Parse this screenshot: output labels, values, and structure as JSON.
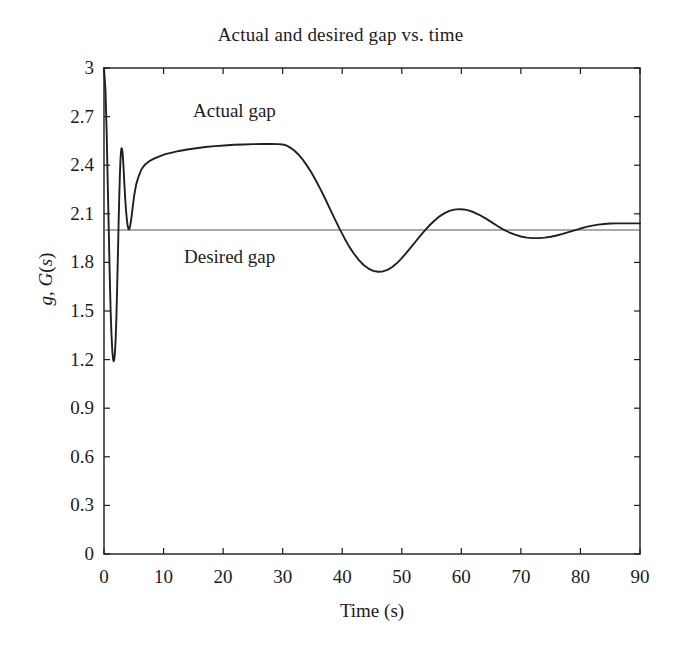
{
  "chart_data": {
    "type": "line",
    "title": "Actual and desired gap vs. time",
    "xlabel": "Time (s)",
    "ylabel": "g, G(s)",
    "ylabel_parts": {
      "pre": "g",
      "sep": ", ",
      "mid": "G",
      "open": "(",
      "var": "s",
      "close": ")"
    },
    "xlim": [
      0,
      90
    ],
    "ylim": [
      0,
      3
    ],
    "xticks": [
      0,
      10,
      20,
      30,
      40,
      50,
      60,
      70,
      80,
      90
    ],
    "xtick_labels": [
      "0",
      "10",
      "20",
      "30",
      "40",
      "50",
      "60",
      "70",
      "80",
      "90"
    ],
    "yticks": [
      0,
      0.3,
      0.6,
      0.9,
      1.2,
      1.5,
      1.8,
      2.1,
      2.4,
      2.7,
      3
    ],
    "ytick_labels": [
      "0",
      "0.3",
      "0.6",
      "0.9",
      "1.2",
      "1.5",
      "1.8",
      "2.1",
      "2.4",
      "2.7",
      "3"
    ],
    "grid": false,
    "legend_position": "inline-annotations",
    "annotations": [
      {
        "text": "Actual gap",
        "x": 15.5,
        "y": 2.74
      },
      {
        "text": "Desired gap",
        "x": 13.8,
        "y": 1.85
      }
    ],
    "series": [
      {
        "name": "Actual gap",
        "color": "#231f20",
        "linewidth": 1.9,
        "points": [
          [
            0.0,
            3.0
          ],
          [
            0.25,
            2.86
          ],
          [
            0.45,
            2.6
          ],
          [
            0.62,
            2.3
          ],
          [
            0.8,
            2.0
          ],
          [
            0.95,
            1.74
          ],
          [
            1.1,
            1.52
          ],
          [
            1.25,
            1.36
          ],
          [
            1.4,
            1.25
          ],
          [
            1.52,
            1.205
          ],
          [
            1.62,
            1.19
          ],
          [
            1.72,
            1.2
          ],
          [
            1.82,
            1.235
          ],
          [
            1.95,
            1.32
          ],
          [
            2.08,
            1.46
          ],
          [
            2.2,
            1.63
          ],
          [
            2.32,
            1.82
          ],
          [
            2.44,
            2.02
          ],
          [
            2.55,
            2.19
          ],
          [
            2.66,
            2.33
          ],
          [
            2.76,
            2.43
          ],
          [
            2.86,
            2.485
          ],
          [
            2.95,
            2.505
          ],
          [
            3.04,
            2.5
          ],
          [
            3.14,
            2.47
          ],
          [
            3.26,
            2.4
          ],
          [
            3.4,
            2.3
          ],
          [
            3.55,
            2.2
          ],
          [
            3.7,
            2.12
          ],
          [
            3.85,
            2.06
          ],
          [
            4.0,
            2.02
          ],
          [
            4.12,
            2.005
          ],
          [
            4.25,
            2.005
          ],
          [
            4.42,
            2.03
          ],
          [
            4.62,
            2.08
          ],
          [
            4.85,
            2.15
          ],
          [
            5.1,
            2.22
          ],
          [
            5.4,
            2.28
          ],
          [
            5.8,
            2.33
          ],
          [
            6.3,
            2.375
          ],
          [
            6.9,
            2.405
          ],
          [
            7.6,
            2.425
          ],
          [
            8.4,
            2.44
          ],
          [
            9.3,
            2.455
          ],
          [
            10.3,
            2.468
          ],
          [
            11.4,
            2.478
          ],
          [
            12.6,
            2.488
          ],
          [
            14.0,
            2.497
          ],
          [
            15.5,
            2.505
          ],
          [
            17.0,
            2.512
          ],
          [
            18.6,
            2.518
          ],
          [
            20.2,
            2.522
          ],
          [
            21.8,
            2.526
          ],
          [
            23.4,
            2.528
          ],
          [
            25.0,
            2.53
          ],
          [
            26.6,
            2.531
          ],
          [
            28.0,
            2.531
          ],
          [
            29.2,
            2.53
          ],
          [
            30.0,
            2.528
          ],
          [
            30.6,
            2.522
          ],
          [
            31.2,
            2.51
          ],
          [
            31.9,
            2.492
          ],
          [
            32.6,
            2.468
          ],
          [
            33.3,
            2.438
          ],
          [
            34.0,
            2.402
          ],
          [
            34.8,
            2.356
          ],
          [
            35.6,
            2.304
          ],
          [
            36.4,
            2.248
          ],
          [
            37.2,
            2.188
          ],
          [
            38.0,
            2.126
          ],
          [
            38.8,
            2.064
          ],
          [
            39.6,
            2.004
          ],
          [
            40.4,
            1.948
          ],
          [
            41.2,
            1.896
          ],
          [
            42.0,
            1.852
          ],
          [
            42.8,
            1.814
          ],
          [
            43.6,
            1.784
          ],
          [
            44.4,
            1.762
          ],
          [
            45.2,
            1.748
          ],
          [
            46.0,
            1.742
          ],
          [
            46.8,
            1.744
          ],
          [
            47.6,
            1.754
          ],
          [
            48.4,
            1.772
          ],
          [
            49.2,
            1.796
          ],
          [
            50.0,
            1.826
          ],
          [
            50.8,
            1.86
          ],
          [
            51.6,
            1.896
          ],
          [
            52.4,
            1.932
          ],
          [
            53.2,
            1.968
          ],
          [
            54.0,
            2.002
          ],
          [
            54.8,
            2.034
          ],
          [
            55.6,
            2.062
          ],
          [
            56.4,
            2.086
          ],
          [
            57.2,
            2.104
          ],
          [
            58.0,
            2.118
          ],
          [
            58.8,
            2.126
          ],
          [
            59.6,
            2.129
          ],
          [
            60.4,
            2.127
          ],
          [
            61.2,
            2.121
          ],
          [
            62.0,
            2.111
          ],
          [
            63.0,
            2.094
          ],
          [
            64.0,
            2.073
          ],
          [
            65.0,
            2.05
          ],
          [
            66.0,
            2.026
          ],
          [
            67.0,
            2.004
          ],
          [
            68.0,
            1.986
          ],
          [
            69.0,
            1.971
          ],
          [
            70.0,
            1.96
          ],
          [
            71.0,
            1.953
          ],
          [
            72.0,
            1.95
          ],
          [
            73.0,
            1.95
          ],
          [
            74.0,
            1.953
          ],
          [
            75.0,
            1.958
          ],
          [
            76.0,
            1.966
          ],
          [
            77.0,
            1.976
          ],
          [
            78.0,
            1.987
          ],
          [
            79.0,
            1.998
          ],
          [
            80.0,
            2.009
          ],
          [
            81.0,
            2.019
          ],
          [
            82.0,
            2.027
          ],
          [
            83.0,
            2.033
          ],
          [
            84.0,
            2.037
          ],
          [
            85.0,
            2.04
          ],
          [
            86.0,
            2.041
          ],
          [
            87.0,
            2.041
          ],
          [
            88.0,
            2.041
          ],
          [
            89.0,
            2.041
          ],
          [
            90.0,
            2.041
          ]
        ]
      },
      {
        "name": "Desired gap",
        "color": "#555555",
        "linewidth": 1.0,
        "constant_value": 2.0,
        "points": [
          [
            0,
            2.0
          ],
          [
            90,
            2.0
          ]
        ]
      }
    ]
  },
  "axes": {
    "frame_color": "#1c1c1c",
    "frame_linewidth": 1.4,
    "tick_direction": "in",
    "tick_length": 6
  }
}
